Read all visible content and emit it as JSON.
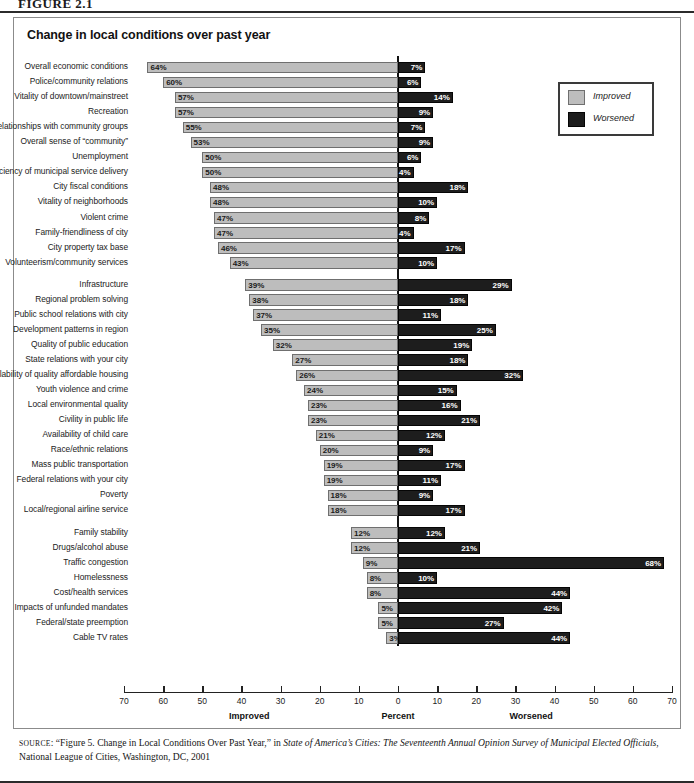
{
  "figure_label": "FIGURE 2.1",
  "chart_title": "Change in local conditions over past year",
  "legend": {
    "improved_label": "Improved",
    "worsened_label": "Worsened",
    "improved_color": "#bdbdbd",
    "worsened_color": "#1d1d1d"
  },
  "axis": {
    "ticks": [
      70,
      60,
      50,
      40,
      30,
      20,
      10,
      0,
      10,
      20,
      30,
      40,
      50,
      60,
      70
    ],
    "left_caption": "Improved",
    "center_caption": "Percent",
    "right_caption": "Worsened",
    "max": 70
  },
  "source": {
    "prefix": "SOURCE",
    "line1_a": ": “Figure 5. Change in Local Conditions Over Past Year,” in ",
    "line1_italic": "State of America’s Cities: The Seventeenth Annual Opinion Survey of Municipal Elected",
    "line2_italic": "Officials",
    "line2_b": ", National League of Cities, Washington, DC, 2001"
  },
  "chart_data": {
    "type": "bar",
    "title": "Change in local conditions over past year",
    "xlabel": "Percent",
    "ylabel": "",
    "xlim": [
      -70,
      70
    ],
    "grid": false,
    "legend_position": "top-right",
    "orientation": "horizontal-diverging",
    "categories": [
      "Overall economic conditions",
      "Police/community relations",
      "Vitality of downtown/mainstreet",
      "Recreation",
      "City relationships with community groups",
      "Overall sense of “community”",
      "Unemployment",
      "Efficiency of municipal service delivery",
      "City fiscal conditions",
      "Vitality of neighborhoods",
      "Violent crime",
      "Family-friendliness of city",
      "City property tax base",
      "Volunteerism/community services",
      "Infrastructure",
      "Regional problem solving",
      "Public school relations with city",
      "Development patterns in region",
      "Quality of public education",
      "State relations with your city",
      "Availability of quality affordable housing",
      "Youth violence and crime",
      "Local environmental quality",
      "Civility in public life",
      "Availability of child care",
      "Race/ethnic relations",
      "Mass public transportation",
      "Federal relations with your city",
      "Poverty",
      "Local/regional airline service",
      "Family stability",
      "Drugs/alcohol abuse",
      "Traffic congestion",
      "Homelessness",
      "Cost/health services",
      "Impacts of unfunded mandates",
      "Federal/state preemption",
      "Cable TV rates"
    ],
    "series": [
      {
        "name": "Improved",
        "color": "#bdbdbd",
        "values": [
          64,
          60,
          57,
          57,
          55,
          53,
          50,
          50,
          48,
          48,
          47,
          47,
          46,
          43,
          39,
          38,
          37,
          35,
          32,
          27,
          26,
          24,
          23,
          23,
          21,
          20,
          19,
          19,
          18,
          18,
          12,
          12,
          9,
          8,
          8,
          5,
          5,
          3
        ]
      },
      {
        "name": "Worsened",
        "color": "#1d1d1d",
        "values": [
          7,
          6,
          14,
          9,
          7,
          9,
          6,
          4,
          18,
          10,
          8,
          4,
          17,
          10,
          29,
          18,
          11,
          25,
          19,
          18,
          32,
          15,
          16,
          21,
          12,
          9,
          17,
          11,
          9,
          17,
          12,
          21,
          68,
          10,
          44,
          42,
          27,
          44
        ]
      }
    ],
    "labels": {
      "improved": [
        "64%",
        "60%",
        "57%",
        "57%",
        "55%",
        "53%",
        "50%",
        "50%",
        "48%",
        "48%",
        "47%",
        "47%",
        "46%",
        "43%",
        "39%",
        "38%",
        "37%",
        "35%",
        "32%",
        "27%",
        "26%",
        "24%",
        "23%",
        "23%",
        "21%",
        "20%",
        "19%",
        "19%",
        "18%",
        "18%",
        "12%",
        "12%",
        "9%",
        "8%",
        "8%",
        "5%",
        "5%",
        "3%"
      ],
      "worsened": [
        "7%",
        "6%",
        "14%",
        "9%",
        "7%",
        "9%",
        "6%",
        "4%",
        "18%",
        "10%",
        "8%",
        "4%",
        "17%",
        "10%",
        "29%",
        "18%",
        "11%",
        "25%",
        "19%",
        "18%",
        "32%",
        "15%",
        "16%",
        "21%",
        "12%",
        "9%",
        "17%",
        "11%",
        "9%",
        "17%",
        "12%",
        "21%",
        "68%",
        "10%",
        "44%",
        "42%",
        "27%",
        "44%"
      ]
    },
    "group_breaks_after": [
      13,
      29
    ]
  }
}
